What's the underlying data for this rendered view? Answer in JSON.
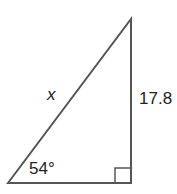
{
  "figure": {
    "type": "right-triangle",
    "hypotenuse_label": "x",
    "vertical_leg_label": "17.8",
    "angle_label": "54°",
    "right_angle_marker": true,
    "stroke_color": "#555555"
  }
}
